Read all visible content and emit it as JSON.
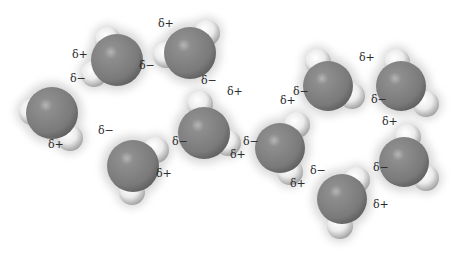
{
  "diagram": {
    "colors": {
      "oxygen": "#8a8a8a",
      "oxygen_highlight": "#b5b5b5",
      "oxygen_shadow": "#5e5e5e",
      "hydrogen": "#eeeeee",
      "hydrogen_shadow": "#9a9a9a",
      "glow": "#d9d9d9",
      "label": "#2a2a2a",
      "background": "#ffffff"
    },
    "molecules": [
      {
        "id": "water-1",
        "o": [
          117,
          60
        ],
        "r": 26,
        "h": [
          [
            108,
            40
          ],
          [
            94,
            74
          ]
        ]
      },
      {
        "id": "water-2",
        "o": [
          190,
          53
        ],
        "r": 26,
        "h": [
          [
            207,
            33
          ],
          [
            166,
            55
          ]
        ]
      },
      {
        "id": "water-3",
        "o": [
          52,
          113
        ],
        "r": 26,
        "h": [
          [
            32,
            112
          ],
          [
            70,
            138
          ]
        ]
      },
      {
        "id": "water-4",
        "o": [
          133,
          166
        ],
        "r": 26,
        "h": [
          [
            156,
            150
          ],
          [
            132,
            192
          ]
        ]
      },
      {
        "id": "water-5",
        "o": [
          204,
          133
        ],
        "r": 26,
        "h": [
          [
            200,
            104
          ],
          [
            228,
            143
          ]
        ]
      },
      {
        "id": "water-6",
        "o": [
          280,
          148
        ],
        "r": 25,
        "h": [
          [
            297,
            125
          ],
          [
            290,
            172
          ]
        ]
      },
      {
        "id": "water-7",
        "o": [
          328,
          86
        ],
        "r": 25,
        "h": [
          [
            318,
            62
          ],
          [
            352,
            96
          ]
        ]
      },
      {
        "id": "water-8",
        "o": [
          401,
          86
        ],
        "r": 25,
        "h": [
          [
            397,
            62
          ],
          [
            426,
            104
          ]
        ]
      },
      {
        "id": "water-9",
        "o": [
          404,
          162
        ],
        "r": 25,
        "h": [
          [
            408,
            137
          ],
          [
            426,
            178
          ]
        ]
      },
      {
        "id": "water-10",
        "o": [
          342,
          199
        ],
        "r": 25,
        "h": [
          [
            357,
            180
          ],
          [
            340,
            226
          ]
        ]
      }
    ],
    "labels": [
      {
        "text": "δ+",
        "x": 72,
        "y": 55
      },
      {
        "text": "δ−",
        "x": 70,
        "y": 79
      },
      {
        "text": "δ−",
        "x": 139,
        "y": 66
      },
      {
        "text": "δ+",
        "x": 158,
        "y": 24
      },
      {
        "text": "δ−",
        "x": 201,
        "y": 81
      },
      {
        "text": "δ+",
        "x": 227,
        "y": 92
      },
      {
        "text": "δ+",
        "x": 48,
        "y": 145
      },
      {
        "text": "δ−",
        "x": 98,
        "y": 131
      },
      {
        "text": "δ+",
        "x": 156,
        "y": 174
      },
      {
        "text": "δ−",
        "x": 172,
        "y": 142
      },
      {
        "text": "δ+",
        "x": 230,
        "y": 155
      },
      {
        "text": "δ−",
        "x": 243,
        "y": 142
      },
      {
        "text": "δ+",
        "x": 280,
        "y": 101
      },
      {
        "text": "δ−",
        "x": 293,
        "y": 92
      },
      {
        "text": "δ+",
        "x": 359,
        "y": 58
      },
      {
        "text": "δ−",
        "x": 371,
        "y": 100
      },
      {
        "text": "δ+",
        "x": 382,
        "y": 122
      },
      {
        "text": "δ−",
        "x": 373,
        "y": 168
      },
      {
        "text": "δ+",
        "x": 290,
        "y": 184
      },
      {
        "text": "δ−",
        "x": 310,
        "y": 171
      },
      {
        "text": "δ+",
        "x": 373,
        "y": 205
      }
    ]
  }
}
